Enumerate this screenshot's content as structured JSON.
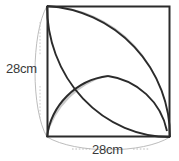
{
  "figure": {
    "background_color": "#ffffff",
    "shape": "square",
    "stroke_color": "#2b2b2b",
    "shade_color": "#c9c9c9",
    "dimension_line_color": "#b0b0b0"
  },
  "dimensions": {
    "height": {
      "label": "28cm",
      "value": 28,
      "unit": "cm",
      "orientation": "vertical",
      "side": "left"
    },
    "width": {
      "label": "28cm",
      "value": 28,
      "unit": "cm",
      "orientation": "horizontal",
      "side": "bottom"
    }
  },
  "geometry": {
    "square": {
      "x": 47,
      "y": 6,
      "width": 123,
      "height": 131,
      "side_cm": 28
    },
    "arcs": [
      {
        "name": "quarter-arc-from-top-left-corner",
        "center": "top-left",
        "radius_cm": 28,
        "from": "bottom-left-corner",
        "to": "top-right-corner"
      },
      {
        "name": "quarter-arc-from-bottom-right-corner",
        "center": "bottom-right",
        "radius_cm": 28,
        "from": "top-right-corner",
        "to": "bottom-left-corner"
      },
      {
        "name": "semicircle-on-left-side",
        "center": "mid-left-edge",
        "radius_cm": 14,
        "from": "top-left-corner",
        "to": "bottom-left-corner"
      }
    ],
    "shaded_regions": [
      {
        "name": "upper-right-crescent",
        "description": "Lune between the two quarter arcs, tapering to the top-left and bottom-right corners"
      },
      {
        "name": "lower-left-lens",
        "description": "Lens (vesica) between the semicircle and a quarter arc, tapering to the bottom-left corner and the square centre"
      }
    ],
    "intersection_point": {
      "name": "arc-crossing",
      "x": 108,
      "y": 76,
      "description": "centre of the square where arcs cross"
    }
  }
}
